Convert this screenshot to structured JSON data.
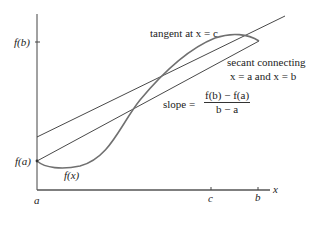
{
  "figure": {
    "type": "mean value theorem illustration",
    "axes": {
      "x_label": "x",
      "x_ticks": [
        "a",
        "c",
        "b"
      ],
      "y_ticks": [
        "f(b)",
        "f(a)"
      ]
    },
    "curve_label": "f(x)",
    "annotations": {
      "tangent": "tangent at x = c",
      "secant_line1": "secant connecting",
      "secant_line2": "x = a and x = b",
      "slope_prefix": "slope =",
      "slope_numerator": "f(b) − f(a)",
      "slope_denominator": "b − a"
    },
    "colors": {
      "axis": "#555555",
      "lines": "#333333",
      "curve": "#6e6e6e"
    }
  }
}
